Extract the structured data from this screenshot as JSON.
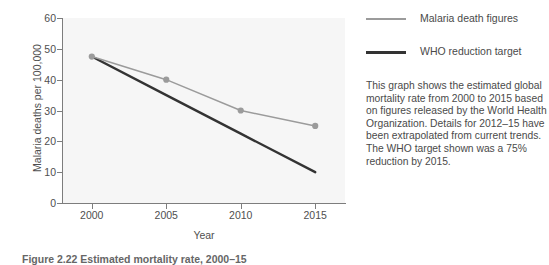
{
  "figure": {
    "caption": "Figure 2.22 Estimated mortality rate, 2000–15"
  },
  "chart_data": {
    "type": "line",
    "title": "",
    "xlabel": "Year",
    "ylabel": "Malaria deaths per 100,000",
    "x": [
      2000,
      2005,
      2010,
      2015
    ],
    "xticklabels": [
      "2000",
      "2005",
      "2010",
      "2015"
    ],
    "xlim": [
      1998,
      2017
    ],
    "ylim": [
      0,
      60
    ],
    "yticks": [
      0,
      10,
      20,
      30,
      40,
      50,
      60
    ],
    "yticklabels": [
      "0",
      "10",
      "20",
      "30",
      "40",
      "50",
      "60"
    ],
    "grid": false,
    "legend_position": "right",
    "series": [
      {
        "name": "Malaria death figures",
        "values": [
          47.5,
          40,
          30,
          25
        ],
        "color": "#9b9b9b",
        "markers": true,
        "marker_color": "#9b9b9b"
      },
      {
        "name": "WHO reduction target",
        "values": [
          47.5,
          35,
          22.5,
          10
        ],
        "color": "#333333",
        "markers": false,
        "marker_color": "#333333"
      }
    ]
  },
  "legend": {
    "items": [
      {
        "label": "Malaria death figures",
        "color": "#9b9b9b",
        "thickness": "1.6px"
      },
      {
        "label": "WHO reduction target",
        "color": "#333333",
        "thickness": "2.6px"
      }
    ]
  },
  "description": {
    "paragraphs": [
      "This graph shows the estimated global mortality rate from 2000 to 2015 based on figures released by the World Health Organization. Details for 2012–15 have been extrapolated from current trends.",
      "The WHO target shown was a 75% reduction by 2015."
    ]
  },
  "colors": {
    "plot_background": "#f6f6f6",
    "axis": "#7d7d7d",
    "text": "#4a4a4a",
    "series_actual": "#9b9b9b",
    "series_target": "#333333"
  }
}
